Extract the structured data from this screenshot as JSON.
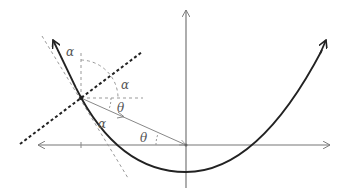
{
  "diagram": {
    "labels": {
      "alpha_top": "α",
      "alpha_right": "α",
      "alpha_lower": "α",
      "theta_upper": "θ",
      "theta_lower": "θ"
    },
    "geometry": {
      "origin": [
        186,
        145
      ],
      "point_P": [
        81,
        98
      ],
      "x_axis": {
        "from": [
          36,
          145
        ],
        "to": [
          330,
          145
        ]
      },
      "y_axis": {
        "from": [
          186,
          188
        ],
        "to": [
          186,
          10
        ]
      },
      "curve_vertex": [
        186,
        172
      ]
    },
    "colors": {
      "curve": "#222222",
      "axes": "#777777",
      "guides": "#999999",
      "normal_line": "#222222",
      "labels": "#555555"
    }
  }
}
